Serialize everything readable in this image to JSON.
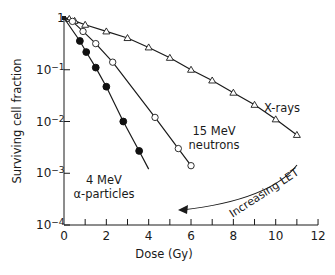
{
  "chart_data": {
    "type": "line",
    "title": "",
    "xlabel": "Dose (Gy)",
    "ylabel": "Surviving cell fraction",
    "xlim": [
      0,
      12
    ],
    "ylim": [
      0.0001,
      1
    ],
    "yscale": "log",
    "grid": false,
    "x_ticks": [
      0,
      2,
      4,
      6,
      8,
      10,
      12
    ],
    "x_tick_labels": [
      "0",
      "2",
      "4",
      "6",
      "8",
      "10",
      "12"
    ],
    "x_minor_ticks": [
      1,
      3,
      5,
      7,
      9,
      11
    ],
    "y_ticks": [
      1,
      0.1,
      0.01,
      0.001,
      0.0001
    ],
    "y_tick_labels": [
      {
        "base": "1",
        "exp": ""
      },
      {
        "base": "10",
        "exp": "−1"
      },
      {
        "base": "10",
        "exp": "−2"
      },
      {
        "base": "10",
        "exp": "−3"
      },
      {
        "base": "10",
        "exp": "−4"
      }
    ],
    "series": [
      {
        "name": "X-rays",
        "label": "X-rays",
        "marker": "open-triangle",
        "x": [
          0,
          0.25,
          0.5,
          1,
          2,
          3,
          4,
          5,
          6,
          7,
          8,
          9,
          10,
          11
        ],
        "values": [
          1,
          0.96,
          0.88,
          0.74,
          0.55,
          0.41,
          0.27,
          0.17,
          0.1,
          0.062,
          0.036,
          0.021,
          0.011,
          0.0055
        ]
      },
      {
        "name": "15 MeV neutrons",
        "label": [
          "15 MeV",
          "neutrons"
        ],
        "marker": "open-circle",
        "x": [
          0,
          0.4,
          0.9,
          1.5,
          2.3,
          4.3,
          5.4,
          6
        ],
        "values": [
          1,
          0.86,
          0.55,
          0.32,
          0.14,
          0.012,
          0.003,
          0.0014
        ]
      },
      {
        "name": "4 MeV α-particles",
        "label": [
          "4 MeV",
          "α-particles"
        ],
        "marker": "filled-circle",
        "x": [
          0,
          0.75,
          1.05,
          1.5,
          2.0,
          2.8,
          3.55
        ],
        "values": [
          1,
          0.36,
          0.22,
          0.11,
          0.047,
          0.01,
          0.0027
        ],
        "line_end": {
          "x": 4.0,
          "y": 0.0012
        }
      }
    ],
    "annotations": [
      {
        "text": "Increasing LET",
        "type": "curved-arrow",
        "direction": "right-to-left",
        "from": [
          11,
          0.0008
        ],
        "to": [
          5.1,
          0.00025
        ]
      }
    ]
  }
}
